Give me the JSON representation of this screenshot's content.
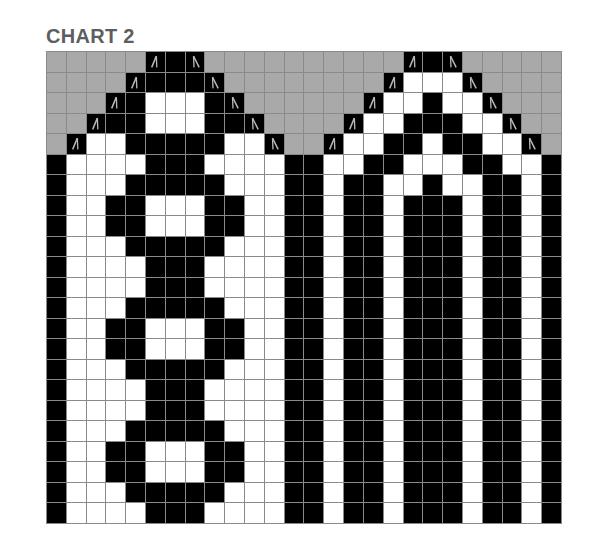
{
  "title": "CHART 2",
  "chart_data": {
    "type": "table",
    "title": "CHART 2",
    "columns": 26,
    "rows": 23,
    "legend": {
      "G": {
        "meaning": "no stitch / background",
        "color": "#a9a9a9"
      },
      "W": {
        "meaning": "white (contrast color)",
        "color": "#ffffff"
      },
      "B": {
        "meaning": "black (main color)",
        "color": "#000000"
      },
      "L": {
        "meaning": "black, left-slanting decrease symbol",
        "color": "#000000",
        "icon": "left-decrease-icon"
      },
      "R": {
        "meaning": "black, right-slanting decrease symbol",
        "color": "#000000",
        "icon": "right-decrease-icon"
      }
    },
    "grid": [
      "GGGGGLBRGGGGGGGGGGLBRGGGGG",
      "GGGGLBBBRGGGGGGGGLWWWRGGGG",
      "GGGLBWWWBRGGGGGGLWWBWWRGGG",
      "GGLBBWWWBBRGGGGLWWBBBWWRGG",
      "GLWWBBBBBWWRGGLWWBBWBBWWRG",
      "BWWWWBBBWWWWBBWWBBWWWBBWWB",
      "BWWWBBBBBWWWBBWBBWWBWWBBWB",
      "BWWBBWWWBBWWBBWBBWBBBWBBWB",
      "BWWBBWWWBBWWBBWBBWBBBWBBWB",
      "BWWWBBBBBWWWBBWBBWBBBWBBWB",
      "BWWWWBBBWWWWBBWBBWBBBWBBWB",
      "BWWWWBBBWWWWBBWBBWBBBWBBWB",
      "BWWWBBBBBWWWBBWBBWBBBWBBWB",
      "BWWBBWWWBBWWBBWBBWBBBWBBWB",
      "BWWBBWWWBBWWBBWBBWBBBWBBWB",
      "BWWWBBBBBWWWBBWBBWBBBWBBWB",
      "BWWWWBBBWWWWBBWBBWBBBWBBWB",
      "BWWWWBBBWWWWBBWBBWBBBWBBWB",
      "BWWWBBBBBWWWBBWBBWBBBWBBWB",
      "BWWBBWWWBBWWBBWBBWBBBWBBWB",
      "BWWBBWWWBBWWBBWBBWBBBWBBWB",
      "BWWWBBBBBWWWBBWBBWBBBWBBWB",
      "BWWWWBBBWWWWBBWBBWBBBWBBWB"
    ]
  }
}
